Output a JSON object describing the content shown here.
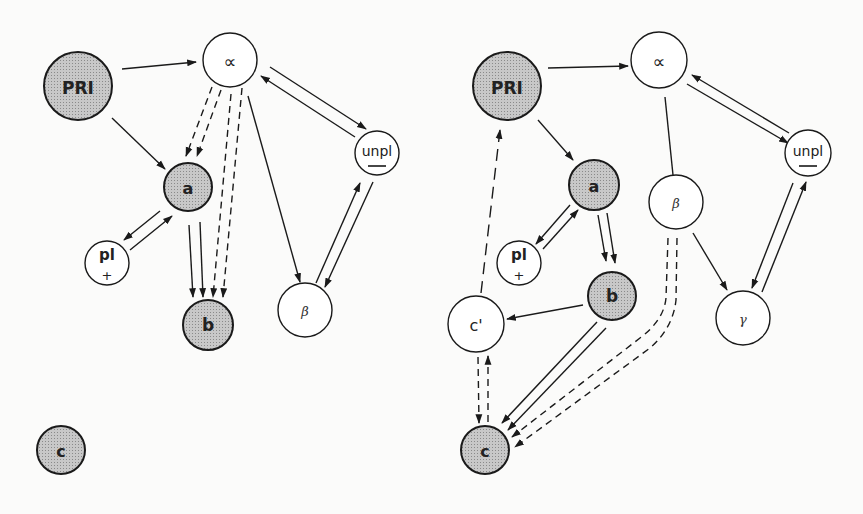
{
  "diagram": {
    "colors": {
      "shaded_fill": "#bdbdbd",
      "stroke": "#1a1a1a",
      "background": "#fbfbfa"
    },
    "panels": [
      {
        "id": "left",
        "nodes": [
          {
            "id": "PRI",
            "label": "PRI",
            "shaded": true
          },
          {
            "id": "alpha",
            "label": "∝",
            "shaded": false
          },
          {
            "id": "a",
            "label": "a",
            "shaded": true
          },
          {
            "id": "pl",
            "label": "pl",
            "sublabel": "+",
            "shaded": false
          },
          {
            "id": "b",
            "label": "b",
            "shaded": true
          },
          {
            "id": "beta",
            "label": "β",
            "shaded": false
          },
          {
            "id": "unpl",
            "label": "unpl",
            "sublabel": "—",
            "shaded": false
          },
          {
            "id": "c",
            "label": "c",
            "shaded": true
          }
        ],
        "edges": [
          {
            "from": "PRI",
            "to": "alpha",
            "style": "solid"
          },
          {
            "from": "PRI",
            "to": "a",
            "style": "solid"
          },
          {
            "from": "alpha",
            "to": "a",
            "style": "dashed",
            "count": 2
          },
          {
            "from": "alpha",
            "to": "b",
            "style": "dashed",
            "count": 2
          },
          {
            "from": "alpha",
            "to": "beta",
            "style": "solid"
          },
          {
            "from": "alpha",
            "to": "unpl",
            "style": "solid"
          },
          {
            "from": "unpl",
            "to": "alpha",
            "style": "solid"
          },
          {
            "from": "a",
            "to": "pl",
            "style": "solid"
          },
          {
            "from": "pl",
            "to": "a",
            "style": "solid"
          },
          {
            "from": "a",
            "to": "b",
            "style": "solid",
            "count": 2
          },
          {
            "from": "beta",
            "to": "unpl",
            "style": "solid"
          },
          {
            "from": "unpl",
            "to": "beta",
            "style": "solid"
          }
        ]
      },
      {
        "id": "right",
        "nodes": [
          {
            "id": "PRI",
            "label": "PRI",
            "shaded": true
          },
          {
            "id": "alpha",
            "label": "∝",
            "shaded": false
          },
          {
            "id": "unpl",
            "label": "unpl",
            "sublabel": "—",
            "shaded": false
          },
          {
            "id": "a",
            "label": "a",
            "shaded": true
          },
          {
            "id": "beta",
            "label": "β",
            "shaded": false
          },
          {
            "id": "pl",
            "label": "pl",
            "sublabel": "+",
            "shaded": false
          },
          {
            "id": "b",
            "label": "b",
            "shaded": true
          },
          {
            "id": "cprime",
            "label": "c'",
            "shaded": false
          },
          {
            "id": "gamma",
            "label": "γ",
            "shaded": false
          },
          {
            "id": "c",
            "label": "c",
            "shaded": true
          }
        ],
        "edges": [
          {
            "from": "PRI",
            "to": "alpha",
            "style": "solid"
          },
          {
            "from": "PRI",
            "to": "a",
            "style": "solid"
          },
          {
            "from": "alpha",
            "to": "beta",
            "style": "solid",
            "arrow": false
          },
          {
            "from": "alpha",
            "to": "unpl",
            "style": "solid"
          },
          {
            "from": "unpl",
            "to": "alpha",
            "style": "solid"
          },
          {
            "from": "a",
            "to": "pl",
            "style": "solid"
          },
          {
            "from": "pl",
            "to": "a",
            "style": "solid"
          },
          {
            "from": "a",
            "to": "b",
            "style": "solid",
            "count": 2
          },
          {
            "from": "b",
            "to": "cprime",
            "style": "solid"
          },
          {
            "from": "b",
            "to": "c",
            "style": "solid",
            "count": 2
          },
          {
            "from": "beta",
            "to": "c",
            "style": "dashed",
            "count": 2
          },
          {
            "from": "beta",
            "to": "gamma",
            "style": "solid"
          },
          {
            "from": "unpl",
            "to": "gamma",
            "style": "solid"
          },
          {
            "from": "gamma",
            "to": "unpl",
            "style": "solid"
          },
          {
            "from": "cprime",
            "to": "PRI",
            "style": "dashed"
          },
          {
            "from": "cprime",
            "to": "c",
            "style": "dashed"
          },
          {
            "from": "c",
            "to": "cprime",
            "style": "dashed"
          }
        ]
      }
    ]
  }
}
